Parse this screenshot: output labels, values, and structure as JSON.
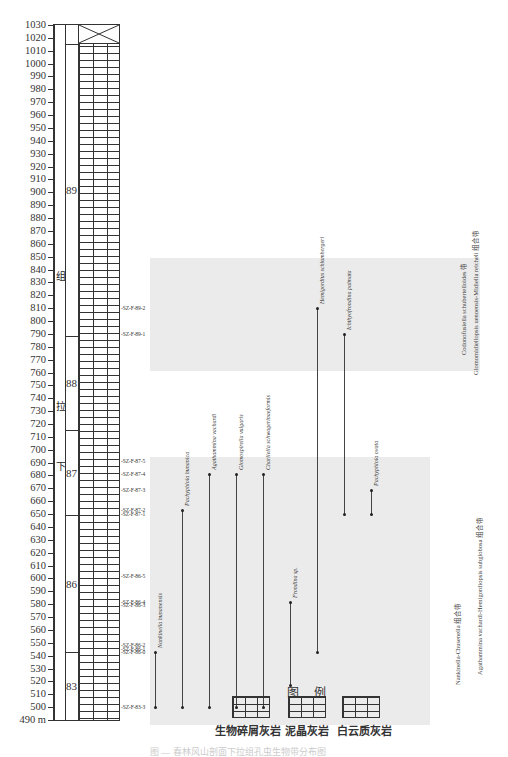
{
  "chart_data": {
    "type": "stratigraphic-range-chart",
    "axis": {
      "unit": "m",
      "min": 490,
      "max": 1030,
      "tick_step": 10,
      "bottom_label": "490 m"
    },
    "formation_label_chars": [
      "下",
      "拉",
      "组"
    ],
    "beds": [
      {
        "id": "83",
        "from": 490,
        "to": 543,
        "lithology": "dolomitic-limestone"
      },
      {
        "id": "86",
        "from": 543,
        "to": 649,
        "lithology": "bioclastic-limestone"
      },
      {
        "id": "87",
        "from": 649,
        "to": 715,
        "lithology": "micritic-limestone"
      },
      {
        "id": "88",
        "from": 715,
        "to": 788,
        "lithology": "bioclastic-limestone-chert"
      },
      {
        "id": "89",
        "from": 788,
        "to": 1015,
        "lithology": "bioclastic-micritic-limestone"
      }
    ],
    "samples": [
      {
        "label": "SZ-F-83-3",
        "y": 500
      },
      {
        "label": "SZ-F-86-0",
        "y": 543
      },
      {
        "label": "SZ-F-86-1",
        "y": 545
      },
      {
        "label": "SZ-F-86-2",
        "y": 548
      },
      {
        "label": "SZ-F-86-3",
        "y": 579
      },
      {
        "label": "SZ-F-86-4",
        "y": 582
      },
      {
        "label": "SZ-F-86-5",
        "y": 602
      },
      {
        "label": "SZ-F-87-1",
        "y": 650
      },
      {
        "label": "SZ-F-87-2",
        "y": 653
      },
      {
        "label": "SZ-F-87-3",
        "y": 669
      },
      {
        "label": "SZ-F-87-4",
        "y": 681
      },
      {
        "label": "SZ-F-87-5",
        "y": 691
      },
      {
        "label": "SZ-F-89-1",
        "y": 790
      },
      {
        "label": "SZ-F-89-2",
        "y": 810
      }
    ],
    "taxa": [
      {
        "name": "Nankinella hunanensis",
        "from": 500,
        "to": 543
      },
      {
        "name": "Pachyphloia hunanica",
        "from": 500,
        "to": 653
      },
      {
        "name": "Agathammina vachardi",
        "from": 500,
        "to": 681
      },
      {
        "name": "Glomospirella vulgaris",
        "from": 500,
        "to": 681
      },
      {
        "name": "Charliella schwagerinaeformis",
        "from": 500,
        "to": 681
      },
      {
        "name": "Frondina sp.",
        "from": 517,
        "to": 582
      },
      {
        "name": "Hemigordius schlumbergeri",
        "from": 543,
        "to": 810
      },
      {
        "name": "Ichthyofrondina palmata",
        "from": 650,
        "to": 790
      },
      {
        "name": "Pachyphloia ovata",
        "from": 650,
        "to": 669
      }
    ],
    "zones": [
      {
        "name": "Nankinella-Chusenella 组合带",
        "from": 490,
        "to": 649
      },
      {
        "name": "Agathammina vachardi-Hemigordiopsis subglobosa 组合带",
        "from": 540,
        "to": 680
      },
      {
        "name": "Glomomidiellopsis uenoensis-Midiella reicheli 组合带",
        "from": 770,
        "to": 855
      },
      {
        "name": "Codonofusiella schubertelloides 带",
        "from": 790,
        "to": 855
      }
    ]
  },
  "legend": {
    "title": "图 例",
    "items": [
      {
        "label": "生物碎屑灰岩",
        "pattern": "bioclastic"
      },
      {
        "label": "泥晶灰岩",
        "pattern": "micritic"
      },
      {
        "label": "白云质灰岩",
        "pattern": "dolomitic"
      }
    ]
  },
  "caption": "图 — 春林风山剖面下拉组孔虫生物带分布图"
}
